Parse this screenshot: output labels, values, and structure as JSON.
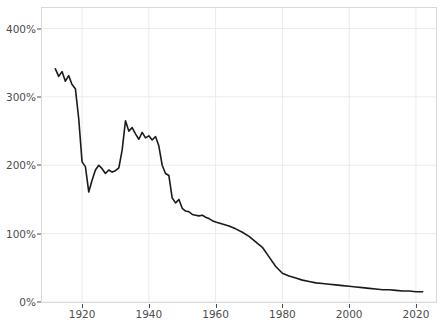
{
  "chart_data": {
    "type": "line",
    "title": "",
    "subtitle": "",
    "xlabel": "",
    "ylabel": "",
    "xlim": [
      1908,
      2026
    ],
    "ylim": [
      0,
      430
    ],
    "grid": true,
    "legend": null,
    "y_tick_labels": [
      "0%",
      "100%",
      "200%",
      "300%",
      "400%"
    ],
    "y_tick_values": [
      0,
      100,
      200,
      300,
      400
    ],
    "x_tick_labels": [
      "1920",
      "1940",
      "1960",
      "1980",
      "2000",
      "2020"
    ],
    "x_tick_values": [
      1920,
      1940,
      1960,
      1980,
      2000,
      2020
    ],
    "series": [
      {
        "name": "value",
        "color": "#1a1a1a",
        "x": [
          1912,
          1913,
          1914,
          1915,
          1916,
          1917,
          1918,
          1919,
          1920,
          1921,
          1922,
          1923,
          1924,
          1925,
          1926,
          1927,
          1928,
          1929,
          1930,
          1931,
          1932,
          1933,
          1934,
          1935,
          1936,
          1937,
          1938,
          1939,
          1940,
          1941,
          1942,
          1943,
          1944,
          1945,
          1946,
          1947,
          1948,
          1949,
          1950,
          1951,
          1952,
          1953,
          1954,
          1955,
          1956,
          1957,
          1958,
          1959,
          1960,
          1962,
          1964,
          1966,
          1968,
          1970,
          1972,
          1974,
          1976,
          1978,
          1980,
          1982,
          1984,
          1986,
          1988,
          1990,
          1992,
          1994,
          1996,
          1998,
          2000,
          2002,
          2004,
          2006,
          2008,
          2010,
          2012,
          2014,
          2016,
          2018,
          2020,
          2022
        ],
        "y": [
          341,
          330,
          337,
          323,
          331,
          318,
          312,
          268,
          205,
          198,
          161,
          178,
          193,
          200,
          195,
          188,
          193,
          190,
          192,
          196,
          222,
          265,
          250,
          255,
          246,
          238,
          248,
          240,
          243,
          237,
          242,
          228,
          200,
          188,
          185,
          152,
          145,
          150,
          137,
          133,
          132,
          128,
          127,
          126,
          127,
          124,
          122,
          119,
          117,
          114,
          111,
          107,
          102,
          96,
          88,
          80,
          66,
          52,
          42,
          38,
          35,
          32,
          30,
          28,
          27,
          26,
          25,
          24,
          23,
          22,
          21,
          20,
          19,
          18,
          18,
          17,
          16,
          16,
          15,
          15
        ]
      }
    ]
  },
  "axes": {
    "y_ticks": [
      {
        "label": "400%",
        "value": 400
      },
      {
        "label": "300%",
        "value": 300
      },
      {
        "label": "200%",
        "value": 200
      },
      {
        "label": "100%",
        "value": 100
      },
      {
        "label": "0%",
        "value": 0
      }
    ],
    "x_ticks": [
      {
        "label": "1920",
        "value": 1920
      },
      {
        "label": "1940",
        "value": 1940
      },
      {
        "label": "1960",
        "value": 1960
      },
      {
        "label": "1980",
        "value": 1980
      },
      {
        "label": "2000",
        "value": 2000
      },
      {
        "label": "2020",
        "value": 2020
      }
    ]
  },
  "style": {
    "line_color": "#1a1a1a",
    "grid_color": "#ebebeb",
    "panel_border_color": "#d9d9d9",
    "tick_label_color": "#4d4d4d",
    "background": "#ffffff"
  }
}
